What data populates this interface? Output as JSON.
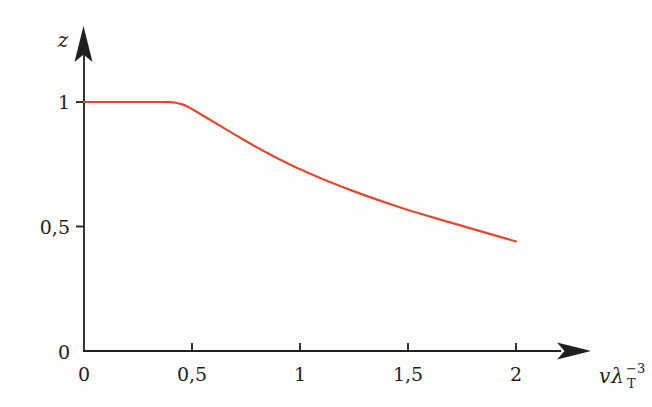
{
  "figure": {
    "background_color": "#fdfdfb",
    "axis_color": "#1f1f1f"
  },
  "chart_data": {
    "type": "line",
    "title": "",
    "ylabel": "z",
    "xlabel": {
      "base": "vλ",
      "sup": "−3",
      "sub": "T"
    },
    "xlim": [
      0,
      2.35
    ],
    "ylim": [
      0,
      1.3
    ],
    "grid": false,
    "legend": "none",
    "x_ticks": [
      {
        "value": 0,
        "label": "0"
      },
      {
        "value": 0.5,
        "label": "0,5"
      },
      {
        "value": 1,
        "label": "1"
      },
      {
        "value": 1.5,
        "label": "1,5"
      },
      {
        "value": 2,
        "label": "2"
      }
    ],
    "y_ticks": [
      {
        "value": 0,
        "label": "0"
      },
      {
        "value": 0.5,
        "label": "0,5"
      },
      {
        "value": 1,
        "label": "1"
      }
    ],
    "series": [
      {
        "name": "fugacity-curve",
        "color": "#dc4b33",
        "points": [
          [
            0,
            1
          ],
          [
            0.3,
            1
          ],
          [
            0.38,
            1
          ],
          [
            0.41,
            0.999
          ],
          [
            0.44,
            0.995
          ],
          [
            0.47,
            0.986
          ],
          [
            0.5,
            0.972
          ],
          [
            0.55,
            0.946
          ],
          [
            0.6,
            0.92
          ],
          [
            0.65,
            0.894
          ],
          [
            0.7,
            0.868
          ],
          [
            0.75,
            0.843
          ],
          [
            0.8,
            0.818
          ],
          [
            0.85,
            0.795
          ],
          [
            0.9,
            0.772
          ],
          [
            0.95,
            0.75
          ],
          [
            1,
            0.73
          ],
          [
            1.1,
            0.692
          ],
          [
            1.2,
            0.657
          ],
          [
            1.3,
            0.625
          ],
          [
            1.4,
            0.595
          ],
          [
            1.5,
            0.566
          ],
          [
            1.6,
            0.54
          ],
          [
            1.7,
            0.515
          ],
          [
            1.8,
            0.49
          ],
          [
            1.9,
            0.465
          ],
          [
            2,
            0.44
          ]
        ]
      }
    ]
  }
}
